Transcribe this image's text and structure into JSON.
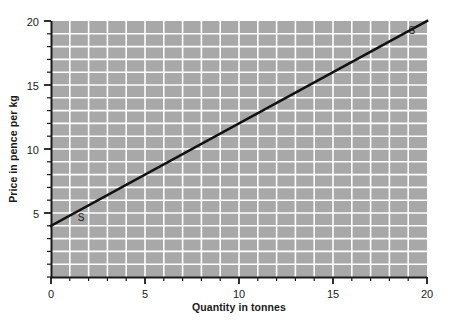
{
  "chart_data": {
    "type": "line",
    "title": "",
    "xlabel": "Quantity in tonnes",
    "ylabel": "Price in pence per kg",
    "xlim": [
      0,
      20
    ],
    "ylim": [
      0,
      20
    ],
    "xticks": [
      0,
      5,
      10,
      15,
      20
    ],
    "yticks": [
      5,
      10,
      15,
      20
    ],
    "xtick_labels": [
      "0",
      "5",
      "10",
      "15",
      "20"
    ],
    "ytick_labels": [
      "5",
      "10",
      "15",
      "20"
    ],
    "minor_tick_step": 1,
    "grid": true,
    "grid_step": 1,
    "legend": "none",
    "plot_background_color": "#a8a8a8",
    "grid_color": "#ffffff",
    "line_color": "#111111",
    "axis_color": "#1a1a1a",
    "series": [
      {
        "name": "S",
        "label": "S",
        "x": [
          0,
          20
        ],
        "values": [
          4,
          20
        ],
        "slope": 0.8,
        "intercept": 4,
        "points": [
          {
            "x": 0,
            "y": 4
          },
          {
            "x": 5,
            "y": 8
          },
          {
            "x": 10,
            "y": 12
          },
          {
            "x": 15,
            "y": 16
          },
          {
            "x": 20,
            "y": 20
          }
        ]
      }
    ],
    "annotations": [
      {
        "text": "S",
        "x": 1.6,
        "y": 4.35,
        "name": "supply-label-lower"
      },
      {
        "text": "S",
        "x": 19.2,
        "y": 19.0,
        "name": "supply-label-upper"
      }
    ]
  }
}
